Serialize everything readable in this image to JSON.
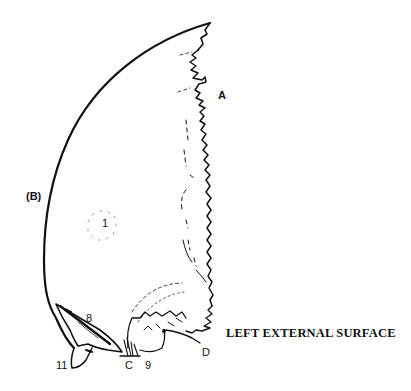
{
  "figure": {
    "caption": "LEFT EXTERNAL SURFACE",
    "labels": {
      "A": "A",
      "B": "(B)",
      "C": "C",
      "D": "D",
      "n1": "1",
      "n8": "8",
      "n9": "9",
      "n11": "11"
    },
    "colors": {
      "ink": "#111111",
      "background": "#ffffff"
    }
  }
}
